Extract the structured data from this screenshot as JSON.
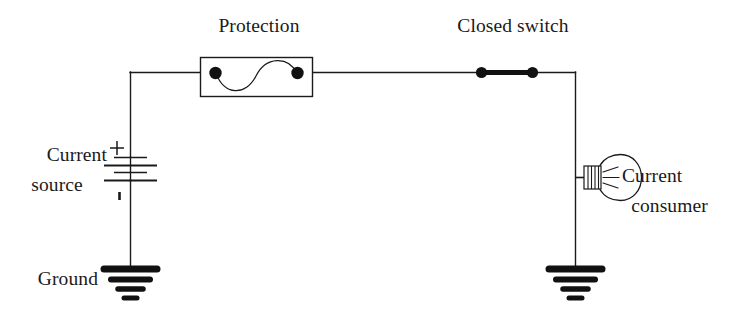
{
  "diagram": {
    "title": "Basic electrical circuit schematic",
    "type": "circuit-schematic",
    "canvas": {
      "width": 729,
      "height": 320,
      "background": "#ffffff"
    },
    "stroke_color": "#1a1a1a",
    "text_color": "#1a1a1a",
    "labels": {
      "protection": "Protection",
      "closed_switch": "Closed switch",
      "current_source_line1": "Current",
      "current_source_line2": "source",
      "current_consumer_line1": "Current",
      "current_consumer_line2": "consumer",
      "ground": "Ground",
      "polarity_positive": "+",
      "polarity_negative": "-"
    },
    "components": [
      {
        "name": "current-source",
        "symbol": "battery",
        "label": "Current source",
        "cells": 2,
        "plates": 4,
        "positive_terminal": "top",
        "negative_terminal": "bottom"
      },
      {
        "name": "protection",
        "symbol": "fuse",
        "label": "Protection",
        "shape": "rectangle-with-sine-wire",
        "terminals": 2
      },
      {
        "name": "closed-switch",
        "symbol": "switch-closed",
        "label": "Closed switch",
        "state": "closed",
        "terminals": 2
      },
      {
        "name": "current-consumer",
        "symbol": "lamp",
        "label": "Current consumer",
        "shape": "incandescent-bulb"
      },
      {
        "name": "ground-left",
        "symbol": "ground",
        "label": "Ground",
        "bars": 4
      },
      {
        "name": "ground-right",
        "symbol": "ground",
        "label": "",
        "bars": 4
      }
    ],
    "wires": [
      {
        "name": "top-rail-left",
        "from": "source-top-corner",
        "to": "protection-left"
      },
      {
        "name": "top-rail-middle",
        "from": "protection-right",
        "to": "switch-left"
      },
      {
        "name": "top-rail-right",
        "from": "switch-right",
        "to": "right-corner"
      },
      {
        "name": "left-branch",
        "from": "top-left-corner",
        "to": "ground-left"
      },
      {
        "name": "right-branch",
        "from": "right-corner",
        "to": "ground-right"
      },
      {
        "name": "lamp-tap",
        "from": "right-branch",
        "to": "lamp-base"
      }
    ]
  }
}
